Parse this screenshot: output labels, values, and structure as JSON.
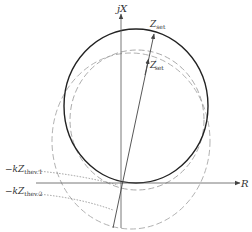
{
  "diagram": {
    "type": "impedance-plane (R-X) relay characteristic",
    "axes": {
      "vertical_label": "jX",
      "horizontal_label": "R"
    },
    "vectors": [
      {
        "name": "Zset",
        "label_main": "Z",
        "label_sub": "set",
        "prime": ""
      },
      {
        "name": "Z'set",
        "label_main": "Z",
        "label_sub": "set",
        "prime": "′"
      }
    ],
    "annotations": [
      {
        "name": "-kZthev.1",
        "prefix": "−k",
        "main": "Z",
        "sub": "thev.1"
      },
      {
        "name": "-kZthev.2",
        "prefix": "−k",
        "main": "Z",
        "sub": "thev.2"
      }
    ],
    "curves": [
      {
        "name": "solid-mho-circle",
        "style": "solid"
      },
      {
        "name": "inner-dashed-circle",
        "style": "dashed"
      },
      {
        "name": "outer-dashed-circle",
        "style": "dashed"
      }
    ],
    "colors": {
      "axis": "#555555",
      "solid_circle": "#222222",
      "dashed_circle": "#999999",
      "dotted_leader": "#777777",
      "text": "#333333"
    }
  }
}
